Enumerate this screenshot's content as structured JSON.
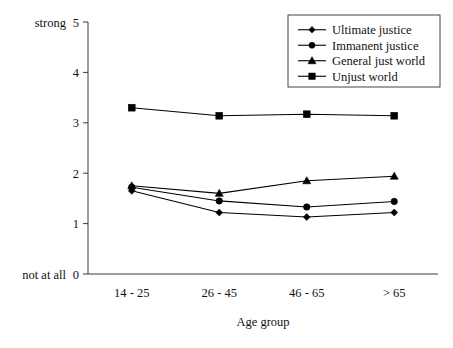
{
  "chart_data": {
    "type": "line",
    "title": "",
    "xlabel": "Age group",
    "ylabel": "",
    "categories": [
      "14 - 25",
      "26 - 45",
      "46 - 65",
      "> 65"
    ],
    "ylim": [
      0,
      5
    ],
    "yticks": [
      0,
      1,
      2,
      3,
      4,
      5
    ],
    "ytick_labels": [
      "0",
      "1",
      "2",
      "3",
      "4",
      "5"
    ],
    "grid": false,
    "legend_position": "top-right",
    "scale_anchors": {
      "high_label": "strong",
      "high_value": "5",
      "low_label": "not at all",
      "low_value": "0"
    },
    "series": [
      {
        "name": "Ultimate justice",
        "marker": "diamond",
        "color": "#000000",
        "values": [
          1.65,
          1.22,
          1.13,
          1.22
        ]
      },
      {
        "name": "Immanent justice",
        "marker": "circle",
        "color": "#000000",
        "values": [
          1.72,
          1.45,
          1.33,
          1.44
        ]
      },
      {
        "name": "General just world",
        "marker": "triangle",
        "color": "#000000",
        "values": [
          1.75,
          1.6,
          1.85,
          1.94
        ]
      },
      {
        "name": "Unjust world",
        "marker": "square",
        "color": "#000000",
        "values": [
          3.3,
          3.14,
          3.17,
          3.14
        ]
      }
    ]
  },
  "layout": {
    "plot_left": 88,
    "plot_right": 438,
    "plot_top": 22,
    "plot_bottom": 274,
    "legend": {
      "x": 288,
      "y": 15,
      "width": 152,
      "height": 72
    }
  }
}
